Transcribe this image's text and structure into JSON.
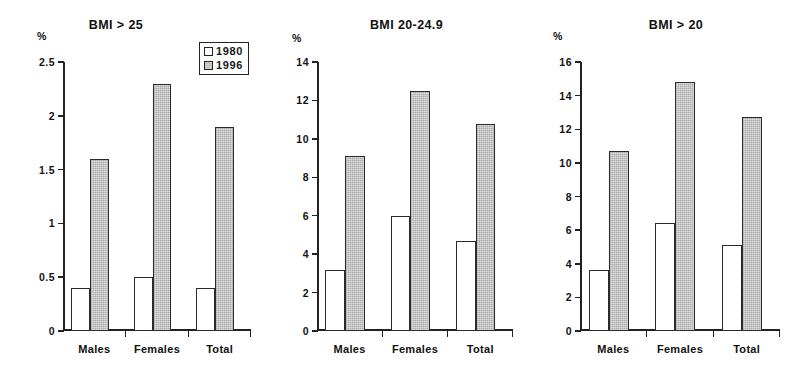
{
  "figure": {
    "axis_unit_label": "%",
    "categories": [
      "Males",
      "Females",
      "Total"
    ],
    "legend": {
      "items": [
        {
          "label": "1980",
          "swatch": "white-square-icon",
          "color": "#ffffff"
        },
        {
          "label": "1996",
          "swatch": "gray-square-icon",
          "color": "#bdbdbd"
        }
      ]
    },
    "colors": {
      "series_1980": "#ffffff",
      "series_1996": "#bdbdbd",
      "axis": "#222222",
      "text": "#111111",
      "background": "#ffffff"
    }
  },
  "chart_data": [
    {
      "type": "bar",
      "title": "BMI > 25",
      "xlabel": "",
      "ylabel": "%",
      "categories": [
        "Males",
        "Females",
        "Total"
      ],
      "series": [
        {
          "name": "1980",
          "values": [
            0.4,
            0.5,
            0.4
          ]
        },
        {
          "name": "1996",
          "values": [
            1.6,
            2.3,
            1.9
          ]
        }
      ],
      "ylim": [
        0,
        2.5
      ],
      "yticks": [
        0,
        0.5,
        1,
        1.5,
        2,
        2.5
      ],
      "ytick_labels": [
        "0",
        "0.5",
        "1",
        "1.5",
        "2",
        "2.5"
      ],
      "grid": false,
      "legend_position": "top-right"
    },
    {
      "type": "bar",
      "title": "BMI 20-24.9",
      "xlabel": "",
      "ylabel": "%",
      "categories": [
        "Males",
        "Females",
        "Total"
      ],
      "series": [
        {
          "name": "1980",
          "values": [
            3.2,
            6.0,
            4.7
          ]
        },
        {
          "name": "1996",
          "values": [
            9.1,
            12.5,
            10.8
          ]
        }
      ],
      "ylim": [
        0,
        14
      ],
      "yticks": [
        0,
        2,
        4,
        6,
        8,
        10,
        12,
        14
      ],
      "ytick_labels": [
        "0",
        "2",
        "4",
        "6",
        "8",
        "10",
        "12",
        "14"
      ],
      "grid": false,
      "legend_position": "none"
    },
    {
      "type": "bar",
      "title": "BMI > 20",
      "xlabel": "",
      "ylabel": "%",
      "categories": [
        "Males",
        "Females",
        "Total"
      ],
      "series": [
        {
          "name": "1980",
          "values": [
            3.6,
            6.4,
            5.1
          ]
        },
        {
          "name": "1996",
          "values": [
            10.7,
            14.8,
            12.7
          ]
        }
      ],
      "ylim": [
        0,
        16
      ],
      "yticks": [
        0,
        2,
        4,
        6,
        8,
        10,
        12,
        14,
        16
      ],
      "ytick_labels": [
        "0",
        "2",
        "4",
        "6",
        "8",
        "10",
        "12",
        "14",
        "16"
      ],
      "grid": false,
      "legend_position": "none"
    }
  ]
}
